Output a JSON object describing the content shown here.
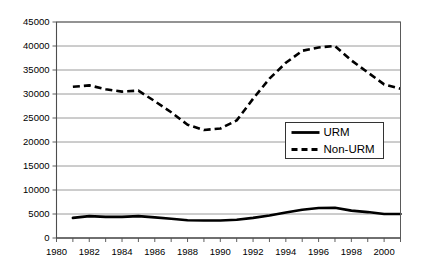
{
  "chart_data": {
    "type": "line",
    "title": "",
    "subtitle": "",
    "xlabel": "",
    "ylabel": "",
    "x": [
      1981,
      1982,
      1983,
      1984,
      1985,
      1986,
      1987,
      1988,
      1989,
      1990,
      1991,
      1992,
      1993,
      1994,
      1995,
      1996,
      1997,
      1998,
      1999,
      2000,
      2001
    ],
    "xlim": [
      1980,
      2001
    ],
    "ylim": [
      0,
      45000
    ],
    "grid": true,
    "legend_position": "inside-right",
    "x_tick_labels": [
      "1980",
      "1982",
      "1984",
      "1986",
      "1988",
      "1990",
      "1992",
      "1994",
      "1996",
      "1998",
      "2000"
    ],
    "x_tick_values": [
      1980,
      1982,
      1984,
      1986,
      1988,
      1990,
      1992,
      1994,
      1996,
      1998,
      2000
    ],
    "x_minor_tick_values": [
      1980,
      1981,
      1982,
      1983,
      1984,
      1985,
      1986,
      1987,
      1988,
      1989,
      1990,
      1991,
      1992,
      1993,
      1994,
      1995,
      1996,
      1997,
      1998,
      1999,
      2000,
      2001
    ],
    "y_tick_labels": [
      "45000",
      "40000",
      "35000",
      "30000",
      "25000",
      "20000",
      "15000",
      "10000",
      "5000",
      "0"
    ],
    "y_tick_values": [
      45000,
      40000,
      35000,
      30000,
      25000,
      20000,
      15000,
      10000,
      5000,
      0
    ],
    "series": [
      {
        "name": "URM",
        "style": "solid",
        "color": "#000000",
        "values": [
          4200,
          4550,
          4400,
          4400,
          4550,
          4300,
          4000,
          3700,
          3650,
          3650,
          3800,
          4200,
          4700,
          5300,
          5900,
          6250,
          6300,
          5700,
          5400,
          5000,
          5000
        ]
      },
      {
        "name": "Non-URM",
        "style": "dashed",
        "color": "#000000",
        "values": [
          31500,
          31800,
          31000,
          30500,
          30700,
          28500,
          26200,
          23600,
          22500,
          22800,
          24500,
          29000,
          33200,
          36500,
          39000,
          39700,
          40000,
          37000,
          34500,
          32000,
          31100
        ]
      }
    ]
  },
  "legend": {
    "entries": [
      {
        "label": "URM",
        "style": "solid"
      },
      {
        "label": "Non-URM",
        "style": "dashed"
      }
    ]
  }
}
